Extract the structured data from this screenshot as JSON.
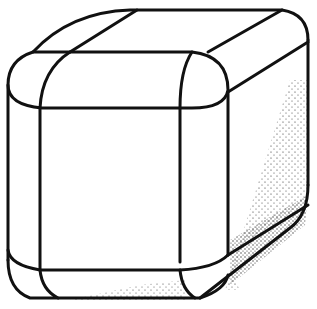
{
  "figure": {
    "stroke_color": "#111111",
    "background": "#ffffff",
    "shading": "stipple"
  }
}
